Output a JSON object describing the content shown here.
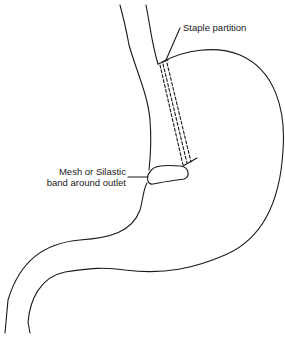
{
  "diagram": {
    "labels": {
      "staple": "Staple partition",
      "band_line1": "Mesh or Silastic",
      "band_line2": "band around outlet"
    }
  }
}
